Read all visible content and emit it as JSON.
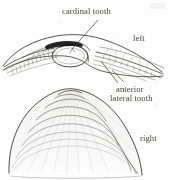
{
  "figure": {
    "kind": "scanned-line-drawing",
    "background_color": "#fdfdfd",
    "ink_color": "#3a3733",
    "dark_accent_color": "#111111",
    "panels": [
      {
        "name": "hinge-detail",
        "position": "top",
        "description": "interior hinge line of a bivalve showing cardinal tooth and anterior lateral teeth"
      },
      {
        "name": "shell-exterior",
        "position": "bottom",
        "description": "fan shaped valve exterior with concentric growth rings"
      }
    ]
  },
  "labels": {
    "cardinal_tooth": "cardinal tooth",
    "left": "left",
    "anterior": "anterior",
    "lateral_tooth": "lateral tooth",
    "right": "right"
  },
  "leaders": [
    {
      "name": "cardinal-tooth-leader",
      "from_label": "cardinal tooth",
      "to_feature": "dark wedge at hinge center"
    },
    {
      "name": "anterior-lateral-leader-upper",
      "from_label": "anterior lateral tooth",
      "to_feature": "upper right hinge blade"
    },
    {
      "name": "anterior-lateral-leader-lower",
      "from_label": "anterior lateral tooth",
      "to_feature": "lower right hinge blade"
    }
  ],
  "shell": {
    "growth_ring_count": 8,
    "radial_stria_count": 11
  }
}
